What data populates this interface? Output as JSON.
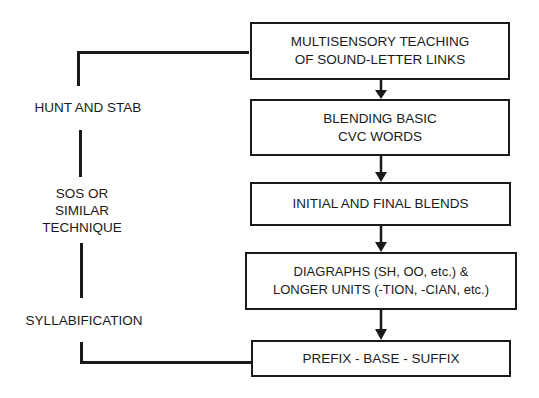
{
  "flow_boxes": [
    {
      "lines": [
        "MULTISENSORY TEACHING",
        "OF SOUND-LETTER LINKS"
      ]
    },
    {
      "lines": [
        "BLENDING BASIC",
        "CVC WORDS"
      ]
    },
    {
      "lines": [
        "INITIAL AND FINAL BLENDS"
      ]
    },
    {
      "lines": [
        "DIAGRAPHS (SH, OO, etc.) &",
        "LONGER UNITS (-TION, -CIAN, etc.)"
      ]
    },
    {
      "lines": [
        "PREFIX - BASE - SUFFIX"
      ]
    }
  ],
  "side_labels": {
    "hunt": "HUNT AND STAB",
    "sos": [
      "SOS OR",
      "SIMILAR",
      "TECHNIQUE"
    ],
    "syllabification": "SYLLABIFICATION"
  },
  "colors": {
    "ink": "#1a1a1a",
    "background": "#ffffff"
  }
}
